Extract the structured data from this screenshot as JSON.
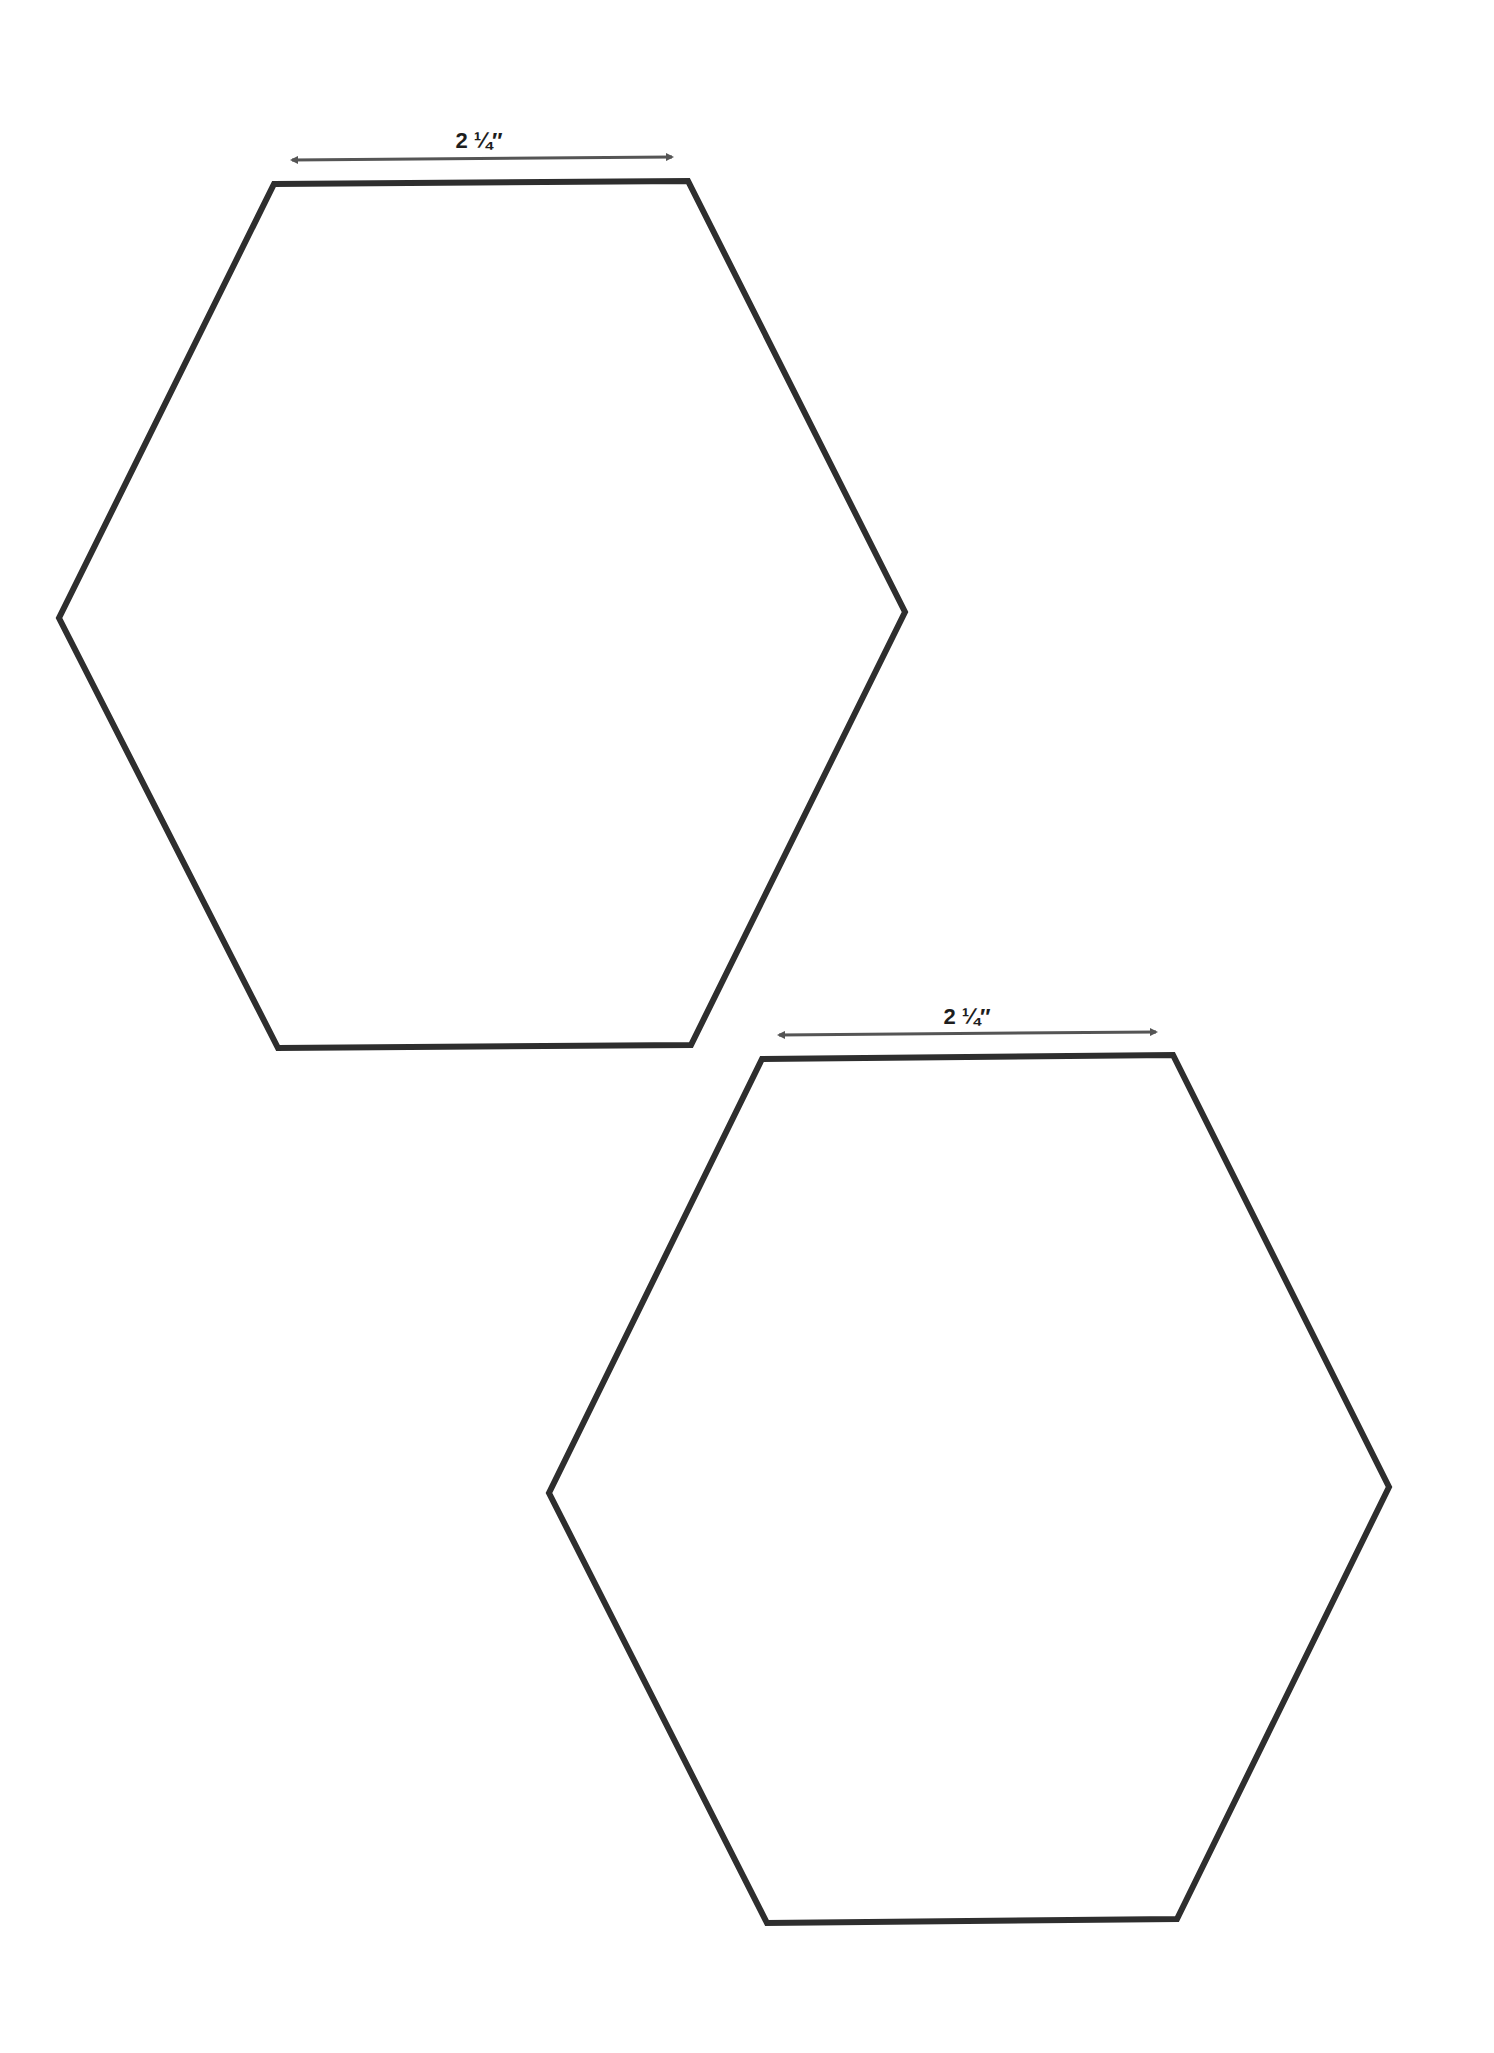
{
  "page": {
    "background": "#ffffff"
  },
  "templates": [
    {
      "name": "hexagon-1",
      "dimension_label": "2 ¼″",
      "stroke_color": "#2e2e2e",
      "arrow_color": "#555555"
    },
    {
      "name": "hexagon-2",
      "dimension_label": "2 ¼″",
      "stroke_color": "#2e2e2e",
      "arrow_color": "#555555"
    }
  ]
}
